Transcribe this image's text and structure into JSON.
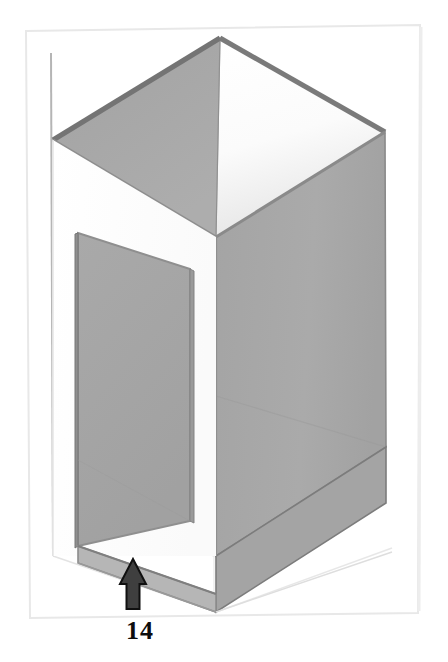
{
  "figure": {
    "kind": "isometric-technical-drawing",
    "background_color": "#ffffff",
    "frame": {
      "name": "page-border",
      "stroke_color": "#e2e2e2",
      "visible": true
    },
    "palette": {
      "face_gray": "#a8a8a8",
      "face_gray_dark": "#9a9a9a",
      "face_gray_light": "#b4b4b4",
      "edge_dark": "#6f6f6f",
      "edge_mid": "#8d8d8d",
      "edge_light": "#cfcfcf",
      "construction_line": "#d8d8d8",
      "white_face": "#ffffff",
      "arrow_fill": "#3a3a3a",
      "arrow_stroke": "#111111",
      "label_color": "#0d0d0d"
    },
    "cropped_header_text": "",
    "annotation": {
      "name": "dimension-callout",
      "label": "14",
      "arrow_direction": "up",
      "points_to": "bottom-front-edge"
    },
    "faces": [
      {
        "name": "top-opening-left-interior",
        "shade": "#a8a8a8"
      },
      {
        "name": "top-opening-right-interior",
        "shade": "#f2f2f2"
      },
      {
        "name": "right-outer-wall",
        "shade": "#a8a8a8"
      },
      {
        "name": "interior-partition-panel",
        "shade": "#a6a6a6"
      },
      {
        "name": "front-left-wall-white",
        "shade": "#ffffff"
      },
      {
        "name": "bottom-rail",
        "shade": "#b0b0b0"
      }
    ]
  }
}
